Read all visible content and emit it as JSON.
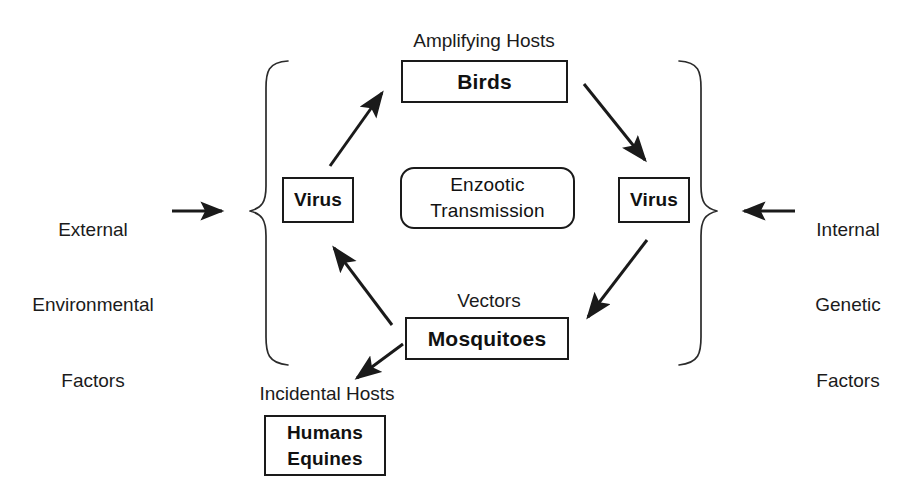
{
  "diagram": {
    "colors": {
      "stroke": "#1a1a1a",
      "text": "#1b1b1b",
      "background": "#ffffff"
    },
    "side_inputs": {
      "left": {
        "line1": "External",
        "line2": "Environmental",
        "line3": "Factors",
        "arrow": "arrow-right-icon"
      },
      "right": {
        "line1": "Internal",
        "line2": "Genetic",
        "line3": "Factors",
        "arrow": "arrow-left-icon"
      }
    },
    "group_labels": {
      "amplifying_hosts": "Amplifying Hosts",
      "vectors": "Vectors",
      "incidental_hosts": "Incidental Hosts"
    },
    "nodes": {
      "birds": "Birds",
      "virus_left": "Virus",
      "virus_right": "Virus",
      "mosquitoes": "Mosquitoes",
      "humans_line1": "Humans",
      "humans_line2": "Equines"
    },
    "center": {
      "line1": "Enzootic",
      "line2": "Transmission"
    },
    "braces": {
      "left": "left-curly-brace",
      "right": "right-curly-brace"
    },
    "cycle_arrows": [
      {
        "name": "virus-left-to-birds",
        "from": "Virus (left)",
        "to": "Birds"
      },
      {
        "name": "birds-to-virus-right",
        "from": "Birds",
        "to": "Virus (right)"
      },
      {
        "name": "virus-right-to-mosquitoes",
        "from": "Virus (right)",
        "to": "Mosquitoes"
      },
      {
        "name": "mosquitoes-to-virus-left",
        "from": "Mosquitoes",
        "to": "Virus (left)"
      },
      {
        "name": "mosquitoes-to-incidental-hosts",
        "from": "Mosquitoes",
        "to": "Incidental Hosts"
      }
    ]
  }
}
